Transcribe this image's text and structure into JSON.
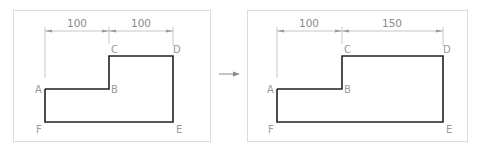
{
  "diagram": {
    "before": {
      "dimensions": [
        "100",
        "100"
      ],
      "points": {
        "A": "A",
        "B": "B",
        "C": "C",
        "D": "D",
        "E": "E",
        "F": "F"
      }
    },
    "after": {
      "dimensions": [
        "100",
        "150"
      ],
      "points": {
        "A": "A",
        "B": "B",
        "C": "C",
        "D": "D",
        "E": "E",
        "F": "F"
      }
    },
    "transition": "arrow-right",
    "colors": {
      "outline": "#222222",
      "dimension": "#b8b8b8",
      "label": "#9a9a9a",
      "frame": "#dcdcdc"
    }
  }
}
